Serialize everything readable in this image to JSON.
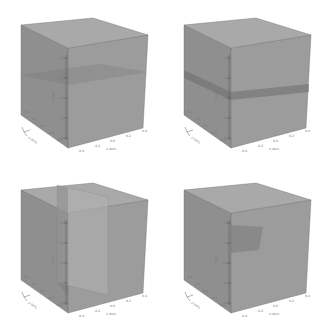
{
  "figure": {
    "layout": "2x2 grid of 3D cube renderings",
    "note": "Tick label text is too blurred to read; the tick values below are estimated from the visible layout pattern, not read from the pixels.",
    "colors": {
      "background": "#ffffff",
      "top_face": "#a9a9a9",
      "left_face": "#8f8f8f",
      "right_face": "#9c9c9c",
      "edge": "#6d6d6d",
      "feature_dark": "#6e6e6e",
      "slab_light": "#b3b3b3"
    },
    "axes": {
      "x_label": "x-axis",
      "y_label": "y-axis",
      "z_label": "z-axis",
      "x_ticks_estimated": [
        "-0.4",
        "-0.2",
        "0.0",
        "0.2",
        "0.4"
      ],
      "y_ticks_estimated": [
        "0.4",
        "0.2",
        "0.0",
        "-0.2",
        "-0.4"
      ],
      "z_ticks_estimated": [
        "0.4",
        "0.2",
        "0.0",
        "-0.2",
        "-0.4"
      ]
    },
    "panels": [
      {
        "id": "top-left",
        "feature": "faint horizontal plane at mid-height"
      },
      {
        "id": "top-right",
        "feature": "dark horizontal band at mid-height"
      },
      {
        "id": "bottom-left",
        "feature": "vertical slab (lighter panel) through cube"
      },
      {
        "id": "bottom-right",
        "feature": "small dark region near top of front edge"
      }
    ]
  }
}
